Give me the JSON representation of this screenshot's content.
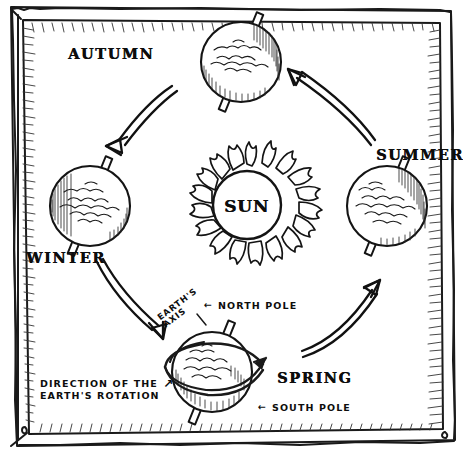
{
  "diagram": {
    "style": "hand-drawn pen sketch on white paper with hatched border frame",
    "center": {
      "name": "sun",
      "label": "SUN",
      "rays": 16
    },
    "seasons": [
      {
        "key": "autumn",
        "label": "AUTUMN",
        "position": "top",
        "globe_cx": 241,
        "globe_cy": 62,
        "globe_r": 40,
        "label_x": 68,
        "label_y": 45,
        "axis_tilt_deg": 22
      },
      {
        "key": "winter",
        "label": "WINTER",
        "position": "left",
        "globe_cx": 90,
        "globe_cy": 206,
        "globe_r": 40,
        "label_x": 26,
        "label_y": 249,
        "axis_tilt_deg": 22
      },
      {
        "key": "spring",
        "label": "SPRING",
        "position": "bottom",
        "globe_cx": 212,
        "globe_cy": 372,
        "globe_r": 40,
        "label_x": 277,
        "label_y": 369,
        "axis_tilt_deg": 22
      },
      {
        "key": "summer",
        "label": "SUMMER",
        "position": "right",
        "globe_cx": 387,
        "globe_cy": 206,
        "globe_r": 40,
        "label_x": 376,
        "label_y": 146,
        "axis_tilt_deg": 22
      }
    ],
    "orbit_arrows": [
      {
        "name": "autumn-to-winter",
        "from": "autumn",
        "to": "winter",
        "direction": "down-left"
      },
      {
        "name": "winter-to-spring",
        "from": "winter",
        "to": "spring",
        "direction": "down-right"
      },
      {
        "name": "spring-to-summer",
        "from": "spring",
        "to": "summer",
        "direction": "up-right"
      },
      {
        "name": "summer-to-autumn",
        "from": "summer",
        "to": "autumn",
        "direction": "up-left"
      }
    ],
    "orbit_direction": "counter-clockwise",
    "annotations": {
      "earths_axis": {
        "line1": "EARTH'S",
        "line2": "AXIS",
        "rotation_deg": -37
      },
      "north_pole": {
        "arrow": "←",
        "text": "NORTH POLE"
      },
      "south_pole": {
        "arrow": "←",
        "text": "SOUTH POLE"
      },
      "earth_rotation": {
        "line1": "DIRECTION OF THE",
        "line2": "EARTH'S ROTATION",
        "arrow": "↗"
      }
    },
    "colors": {
      "ink": "#1a1a1a",
      "paper": "#ffffff",
      "hatch": "#2b2b2b"
    }
  }
}
